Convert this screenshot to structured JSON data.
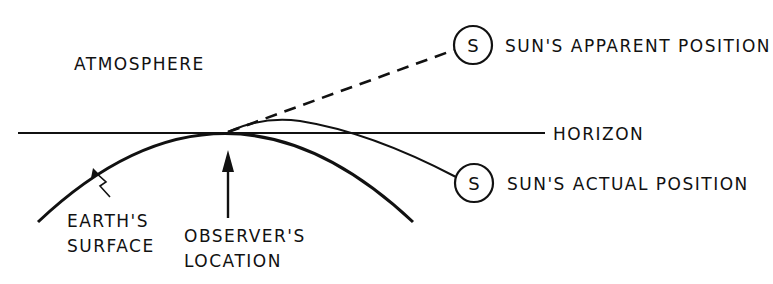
{
  "diagram": {
    "type": "atmospheric-refraction",
    "colors": {
      "ink": "#111111",
      "background": "#ffffff"
    },
    "labels": {
      "atmosphere": "ATMOSPHERE",
      "horizon": "HORIZON",
      "sun_apparent": "SUN'S APPARENT POSITION",
      "sun_actual": "SUN'S ACTUAL POSITION",
      "earth_line1": "EARTH'S",
      "earth_line2": "SURFACE",
      "observer_line1": "OBSERVER'S",
      "observer_line2": "LOCATION"
    },
    "sun_symbol": "S",
    "elements": {
      "horizon_line": "solid horizontal line",
      "earth_surface": "curved arc",
      "apparent_ray": "dashed line to apparent sun",
      "refracted_ray": "curved solid line to actual sun",
      "observer_arrow": "vertical arrow pointing up"
    }
  }
}
